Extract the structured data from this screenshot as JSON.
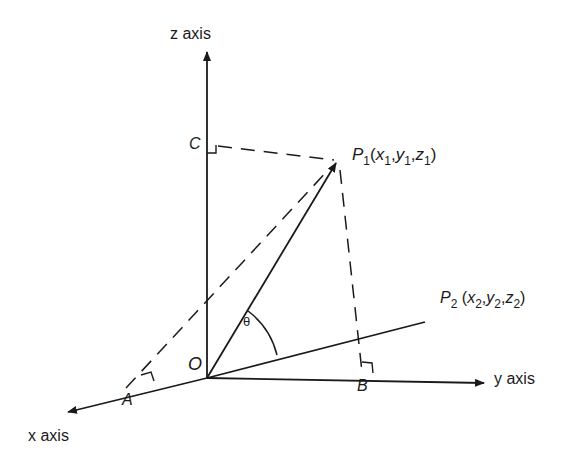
{
  "diagram": {
    "type": "3d-vector-angle",
    "axes": {
      "z": "z axis",
      "y": "y axis",
      "x": "x axis"
    },
    "points": {
      "origin": "O",
      "A": "A",
      "B": "B",
      "C": "C",
      "P1": {
        "name": "P",
        "sub": "1",
        "coords": [
          "x",
          "1",
          "y",
          "1",
          "z",
          "1"
        ]
      },
      "P2": {
        "name": "P",
        "sub": "2",
        "coords": [
          "x",
          "2",
          "y",
          "2",
          "z",
          "2"
        ]
      }
    },
    "angle": "θ",
    "colors": {
      "ink": "#1a1a1a",
      "background": "#ffffff"
    }
  }
}
